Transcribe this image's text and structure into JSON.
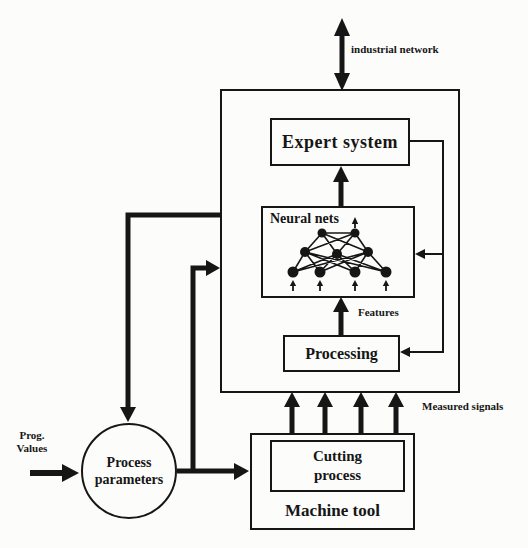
{
  "colors": {
    "ink": "#161616",
    "paper": "#fcfcfb"
  },
  "top": {
    "industrial_network": "industrial network"
  },
  "system_box": {
    "expert_system": "Expert system",
    "neural_nets": "Neural nets",
    "features": "Features",
    "processing": "Processing"
  },
  "signals": {
    "measured": "Measured signals"
  },
  "machine_tool": {
    "title": "Machine tool",
    "cutting_process": {
      "line1": "Cutting",
      "line2": "process"
    }
  },
  "inputs": {
    "process_parameters": {
      "line1": "Process",
      "line2": "parameters"
    },
    "prog_values": {
      "line1": "Prog.",
      "line2": "Values"
    }
  }
}
